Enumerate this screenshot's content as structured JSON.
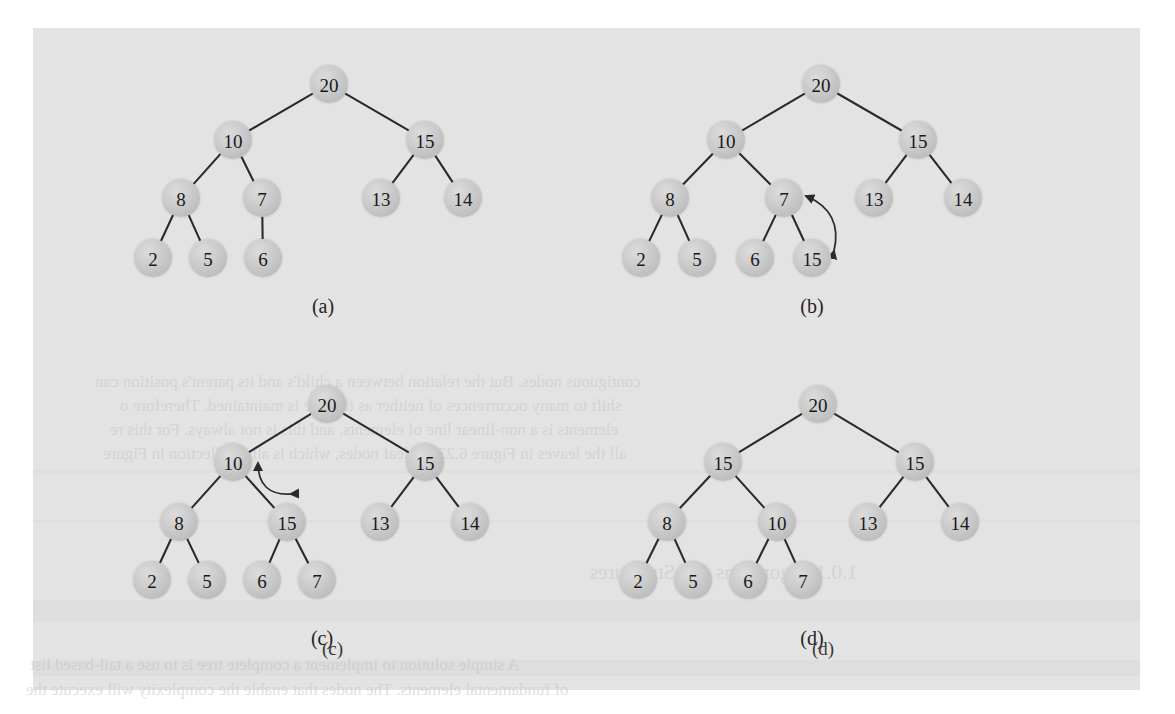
{
  "figure": {
    "kind": "binary-heap-sequence",
    "panel_count": 4,
    "background_color": "#e3e3e3",
    "node_fill_color": "#c9c9c9",
    "edge_color": "#2b2b2b",
    "label_color": "#1a1a1a",
    "node_radius": 19
  },
  "ghost_text": {
    "lines": [
      {
        "text": "contiguous nodes. But the relation between a child's and its parent's position can",
        "x": 95,
        "y": 372,
        "size": 17
      },
      {
        "text": "shift to many occurrences of neither as the tree is maintained. Therefore o",
        "x": 120,
        "y": 396,
        "size": 17
      },
      {
        "text": "elements is a non-linear line of elements, and this is not always. For this re",
        "x": 110,
        "y": 420,
        "size": 17
      },
      {
        "text": "all the leaves in Figure 6.23 are leaf nodes, which is all a collection in Figure",
        "x": 103,
        "y": 444,
        "size": 17
      },
      {
        "text": "1.0.1 Algorithms and Structures",
        "x": 590,
        "y": 560,
        "size": 21
      },
      {
        "text": "A simple solution to implement a complete tree is to use a tail-based list",
        "x": 30,
        "y": 655,
        "size": 17
      },
      {
        "text": "of fundamental elements. The nodes that enable the complexity will execute the",
        "x": 26,
        "y": 680,
        "size": 17
      },
      {
        "text": "(c)",
        "x": 322,
        "y": 638,
        "size": 19
      },
      {
        "text": "(d)",
        "x": 812,
        "y": 638,
        "size": 19
      }
    ]
  },
  "panels": [
    {
      "id": "panel-a",
      "label": "(a)",
      "label_pos": {
        "x": 323,
        "y": 306
      },
      "nodes": [
        {
          "id": "a-20",
          "value": "20",
          "x": 329,
          "y": 84
        },
        {
          "id": "a-10",
          "value": "10",
          "x": 233,
          "y": 140
        },
        {
          "id": "a-15",
          "value": "15",
          "x": 425,
          "y": 140
        },
        {
          "id": "a-8",
          "value": "8",
          "x": 181,
          "y": 198
        },
        {
          "id": "a-7",
          "value": "7",
          "x": 262,
          "y": 198
        },
        {
          "id": "a-13",
          "value": "13",
          "x": 381,
          "y": 198
        },
        {
          "id": "a-14",
          "value": "14",
          "x": 463,
          "y": 198
        },
        {
          "id": "a-2",
          "value": "2",
          "x": 153,
          "y": 258
        },
        {
          "id": "a-5",
          "value": "5",
          "x": 208,
          "y": 258
        },
        {
          "id": "a-6",
          "value": "6",
          "x": 263,
          "y": 258
        }
      ],
      "edges": [
        [
          "a-20",
          "a-10"
        ],
        [
          "a-20",
          "a-15"
        ],
        [
          "a-10",
          "a-8"
        ],
        [
          "a-10",
          "a-7"
        ],
        [
          "a-15",
          "a-13"
        ],
        [
          "a-15",
          "a-14"
        ],
        [
          "a-8",
          "a-2"
        ],
        [
          "a-8",
          "a-5"
        ],
        [
          "a-7",
          "a-6"
        ]
      ],
      "swap_arrows": []
    },
    {
      "id": "panel-b",
      "label": "(b)",
      "label_pos": {
        "x": 812,
        "y": 306
      },
      "nodes": [
        {
          "id": "b-20",
          "value": "20",
          "x": 821,
          "y": 84
        },
        {
          "id": "b-10",
          "value": "10",
          "x": 726,
          "y": 140
        },
        {
          "id": "b-15r",
          "value": "15",
          "x": 918,
          "y": 140
        },
        {
          "id": "b-8",
          "value": "8",
          "x": 670,
          "y": 198
        },
        {
          "id": "b-7",
          "value": "7",
          "x": 784,
          "y": 198
        },
        {
          "id": "b-13",
          "value": "13",
          "x": 874,
          "y": 198
        },
        {
          "id": "b-14",
          "value": "14",
          "x": 963,
          "y": 198
        },
        {
          "id": "b-2",
          "value": "2",
          "x": 641,
          "y": 258
        },
        {
          "id": "b-5",
          "value": "5",
          "x": 697,
          "y": 258
        },
        {
          "id": "b-6",
          "value": "6",
          "x": 755,
          "y": 258
        },
        {
          "id": "b-15n",
          "value": "15",
          "x": 812,
          "y": 258
        }
      ],
      "edges": [
        [
          "b-20",
          "b-10"
        ],
        [
          "b-20",
          "b-15r"
        ],
        [
          "b-10",
          "b-8"
        ],
        [
          "b-10",
          "b-7"
        ],
        [
          "b-15r",
          "b-13"
        ],
        [
          "b-15r",
          "b-14"
        ],
        [
          "b-8",
          "b-2"
        ],
        [
          "b-8",
          "b-5"
        ],
        [
          "b-7",
          "b-6"
        ],
        [
          "b-7",
          "b-15n"
        ]
      ],
      "swap_arrows": [
        {
          "from": {
            "x": 834,
            "y": 251
          },
          "to": {
            "x": 806,
            "y": 196
          },
          "bulge": 26,
          "double": true
        }
      ]
    },
    {
      "id": "panel-c",
      "label": "(c)",
      "label_pos": {
        "x": 322,
        "y": 638
      },
      "nodes": [
        {
          "id": "c-20",
          "value": "20",
          "x": 327,
          "y": 404
        },
        {
          "id": "c-10",
          "value": "10",
          "x": 233,
          "y": 462
        },
        {
          "id": "c-15r",
          "value": "15",
          "x": 425,
          "y": 462
        },
        {
          "id": "c-8",
          "value": "8",
          "x": 179,
          "y": 522
        },
        {
          "id": "c-15m",
          "value": "15",
          "x": 287,
          "y": 522
        },
        {
          "id": "c-13",
          "value": "13",
          "x": 380,
          "y": 522
        },
        {
          "id": "c-14",
          "value": "14",
          "x": 470,
          "y": 522
        },
        {
          "id": "c-2",
          "value": "2",
          "x": 152,
          "y": 580
        },
        {
          "id": "c-5",
          "value": "5",
          "x": 207,
          "y": 580
        },
        {
          "id": "c-6",
          "value": "6",
          "x": 262,
          "y": 580
        },
        {
          "id": "c-7",
          "value": "7",
          "x": 317,
          "y": 580
        }
      ],
      "edges": [
        [
          "c-20",
          "c-10"
        ],
        [
          "c-20",
          "c-15r"
        ],
        [
          "c-10",
          "c-8"
        ],
        [
          "c-10",
          "c-15m"
        ],
        [
          "c-15r",
          "c-13"
        ],
        [
          "c-15r",
          "c-14"
        ],
        [
          "c-8",
          "c-2"
        ],
        [
          "c-8",
          "c-5"
        ],
        [
          "c-15m",
          "c-6"
        ],
        [
          "c-15m",
          "c-7"
        ]
      ],
      "swap_arrows": [
        {
          "from": {
            "x": 291,
            "y": 494
          },
          "to": {
            "x": 258,
            "y": 463
          },
          "bulge": -24,
          "double": true
        }
      ]
    },
    {
      "id": "panel-d",
      "label": "(d)",
      "label_pos": {
        "x": 812,
        "y": 638
      },
      "nodes": [
        {
          "id": "d-20",
          "value": "20",
          "x": 818,
          "y": 404
        },
        {
          "id": "d-15l",
          "value": "15",
          "x": 723,
          "y": 462
        },
        {
          "id": "d-15r",
          "value": "15",
          "x": 915,
          "y": 462
        },
        {
          "id": "d-8",
          "value": "8",
          "x": 667,
          "y": 522
        },
        {
          "id": "d-10",
          "value": "10",
          "x": 777,
          "y": 522
        },
        {
          "id": "d-13",
          "value": "13",
          "x": 868,
          "y": 522
        },
        {
          "id": "d-14",
          "value": "14",
          "x": 960,
          "y": 522
        },
        {
          "id": "d-2",
          "value": "2",
          "x": 638,
          "y": 580
        },
        {
          "id": "d-5",
          "value": "5",
          "x": 693,
          "y": 580
        },
        {
          "id": "d-6",
          "value": "6",
          "x": 748,
          "y": 580
        },
        {
          "id": "d-7",
          "value": "7",
          "x": 803,
          "y": 580
        }
      ],
      "edges": [
        [
          "d-20",
          "d-15l"
        ],
        [
          "d-20",
          "d-15r"
        ],
        [
          "d-15l",
          "d-8"
        ],
        [
          "d-15l",
          "d-10"
        ],
        [
          "d-15r",
          "d-13"
        ],
        [
          "d-15r",
          "d-14"
        ],
        [
          "d-8",
          "d-2"
        ],
        [
          "d-8",
          "d-5"
        ],
        [
          "d-10",
          "d-6"
        ],
        [
          "d-10",
          "d-7"
        ]
      ],
      "swap_arrows": []
    }
  ]
}
